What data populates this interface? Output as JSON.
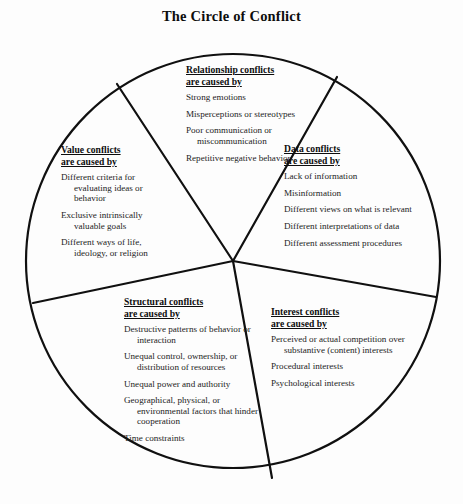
{
  "title": "The Circle of Conflict",
  "colors": {
    "ink": "#1a1a1a",
    "stroke": "#101010",
    "background": "#fdfdfd"
  },
  "diagram": {
    "shape": "circle",
    "center": {
      "x": 233,
      "y": 261
    },
    "radius": 207,
    "divider_endpoints": [
      {
        "x": 117,
        "y": 84
      },
      {
        "x": 337,
        "y": 77
      },
      {
        "x": 33,
        "y": 303
      },
      {
        "x": 436,
        "y": 297
      },
      {
        "x": 272,
        "y": 478
      }
    ]
  },
  "sections": {
    "relationship": {
      "heading_line1": "Relationship conflicts",
      "heading_line2": "are caused by",
      "items": [
        "Strong emotions",
        "Misperceptions or stereotypes",
        "Poor communication or miscommunication",
        "Repetitive negative behavior"
      ]
    },
    "data": {
      "heading_line1": "Data conflicts",
      "heading_line2": "are caused by",
      "items": [
        "Lack of information",
        "Misinformation",
        "Different views on what is relevant",
        "Different interpretations of data",
        "Different assessment procedures"
      ]
    },
    "value": {
      "heading_line1": "Value conflicts",
      "heading_line2": "are caused by",
      "items": [
        "Different criteria for evaluating ideas or behavior",
        "Exclusive intrinsically valuable goals",
        "Different ways of life, ideology, or religion"
      ]
    },
    "structural": {
      "heading_line1": "Structural conflicts",
      "heading_line2": "are caused by",
      "items": [
        "Destructive patterns of behavior or interaction",
        "Unequal control, ownership, or distribution of resources",
        "Unequal power and authority",
        "Geographical, physical, or environmental factors that hinder cooperation",
        "Time constraints"
      ]
    },
    "interest": {
      "heading_line1": "Interest conflicts",
      "heading_line2": "are caused by",
      "items": [
        "Perceived or actual competition over substantive (content) interests",
        "Procedural interests",
        "Psychological interests"
      ]
    }
  }
}
